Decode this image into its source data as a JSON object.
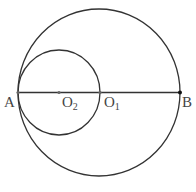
{
  "diagram": {
    "colors": {
      "line": "#333333",
      "label": "#444444",
      "background": "#ffffff"
    },
    "big_circle": {
      "name": "circle-O1",
      "cx": 99,
      "cy": 92.5,
      "rx": 81,
      "ry": 83.5
    },
    "small_circle": {
      "name": "circle-O2",
      "cx": 59,
      "cy": 92.5,
      "rx": 41,
      "ry": 42.5
    },
    "segment_AB": {
      "x1": 18,
      "y1": 92.5,
      "x2": 180,
      "y2": 92.5
    },
    "points": [
      {
        "id": "A",
        "x": 18,
        "y": 92.5,
        "label": "A",
        "sub": "",
        "lx": 4,
        "ly": 107
      },
      {
        "id": "O2",
        "x": 59,
        "y": 92.5,
        "label": "O",
        "sub": "2",
        "lx": 62,
        "ly": 107
      },
      {
        "id": "O1",
        "x": 100,
        "y": 92.5,
        "label": "O",
        "sub": "1",
        "lx": 104,
        "ly": 107
      },
      {
        "id": "B",
        "x": 180,
        "y": 92.5,
        "label": "B",
        "sub": "",
        "lx": 182,
        "ly": 107
      }
    ]
  }
}
